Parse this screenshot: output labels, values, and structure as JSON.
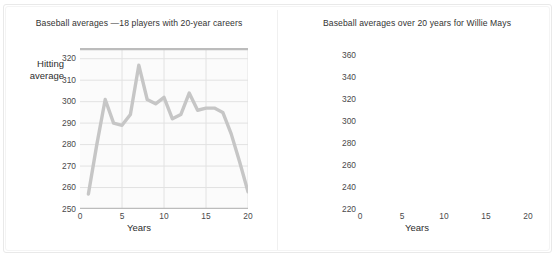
{
  "figure": {
    "background": "#ffffff",
    "frame_color": "#e9e9e9",
    "divider_color": "#f0f0f0",
    "line_color": "#c6c6c6",
    "grid_color": "#e2e2e2",
    "axis_color": "#bcbcbc",
    "plot_bg": "#fbfbfb"
  },
  "chart_data": [
    {
      "id": "left",
      "type": "line",
      "title": "Baseball averages —18 players with 20-year careers",
      "xlabel": "Years",
      "ylabel": "Hitting\naverage",
      "ylabel_line1": "Hitting",
      "ylabel_line2": "average",
      "xlim": [
        0,
        20
      ],
      "ylim": [
        250,
        325
      ],
      "yticks": [
        250,
        260,
        270,
        280,
        290,
        300,
        310,
        320
      ],
      "xticks": [
        0,
        5,
        10,
        15,
        20
      ],
      "grid": true,
      "legend": "none",
      "x": [
        1,
        2,
        3,
        4,
        5,
        6,
        7,
        8,
        9,
        10,
        11,
        12,
        13,
        14,
        15,
        16,
        17,
        18,
        19,
        20
      ],
      "values": [
        257,
        280,
        301,
        290,
        289,
        294,
        317,
        301,
        299,
        302,
        292,
        294,
        304,
        296,
        297,
        297,
        295,
        285,
        272,
        258
      ]
    },
    {
      "id": "right",
      "type": "line",
      "title": "Baseball averages over 20 years for Willie Mays",
      "xlabel": "Years",
      "ylabel": "Hitting\naverage",
      "ylabel_line1": "Hitting",
      "ylabel_line2": "average",
      "xlim": [
        0,
        20
      ],
      "ylim": [
        220,
        370
      ],
      "yticks": [
        220,
        240,
        260,
        280,
        300,
        320,
        340,
        360
      ],
      "xticks": [
        0,
        5,
        10,
        15,
        20
      ],
      "grid": true,
      "legend": "none",
      "x": [
        1,
        2,
        3,
        4,
        5,
        6,
        7,
        8,
        9,
        10,
        11,
        12,
        13,
        14,
        15,
        16,
        17,
        18,
        19,
        20
      ],
      "values": [
        274,
        235,
        345,
        319,
        295,
        338,
        347,
        319,
        313,
        317,
        304,
        308,
        313,
        296,
        317,
        259,
        287,
        279,
        290,
        271
      ]
    }
  ]
}
